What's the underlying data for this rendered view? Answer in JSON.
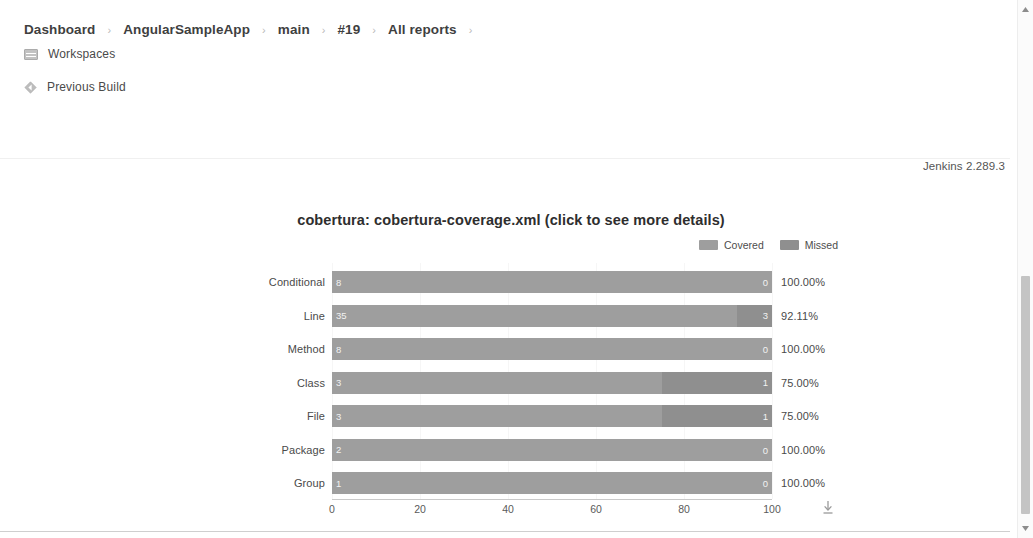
{
  "breadcrumb": {
    "items": [
      {
        "label": "Dashboard"
      },
      {
        "label": "AngularSampleApp"
      },
      {
        "label": "main"
      },
      {
        "label": "#19"
      },
      {
        "label": "All reports"
      }
    ],
    "separator": "›"
  },
  "menu": {
    "workspaces": {
      "label": "Workspaces",
      "icon": "workspaces-icon"
    },
    "previous_build": {
      "label": "Previous Build",
      "icon": "previous-build-icon"
    }
  },
  "footer": {
    "jenkins_version": "Jenkins 2.289.3"
  },
  "chart_panel": {
    "title": "cobertura: cobertura-coverage.xml (click to see more details)",
    "download_icon": "download-icon"
  },
  "colors": {
    "covered": "#9e9e9e",
    "missed": "#8f8f8f",
    "text": "#4a4a4a"
  },
  "chart_data": {
    "type": "bar",
    "title": "cobertura: cobertura-coverage.xml (click to see more details)",
    "xlabel": "",
    "ylabel": "",
    "orientation": "horizontal",
    "stacked": true,
    "grid": false,
    "legend_position": "top-right",
    "xlim": [
      0,
      100
    ],
    "xticks": [
      0,
      20,
      40,
      60,
      80,
      100
    ],
    "categories": [
      "Conditional",
      "Line",
      "Method",
      "Class",
      "File",
      "Package",
      "Group"
    ],
    "legend": [
      "Covered",
      "Missed"
    ],
    "series": [
      {
        "name": "Covered",
        "values": [
          8,
          35,
          8,
          3,
          3,
          2,
          1
        ]
      },
      {
        "name": "Missed",
        "values": [
          0,
          3,
          0,
          1,
          1,
          0,
          0
        ]
      }
    ],
    "percent_labels": [
      "100.00%",
      "92.11%",
      "100.00%",
      "75.00%",
      "75.00%",
      "100.00%",
      "100.00%"
    ],
    "rows": [
      {
        "category": "Conditional",
        "covered": 8,
        "missed": 0,
        "percent": "100.00%",
        "covered_pct": 100,
        "missed_pct": 0
      },
      {
        "category": "Line",
        "covered": 35,
        "missed": 3,
        "percent": "92.11%",
        "covered_pct": 92.11,
        "missed_pct": 7.89
      },
      {
        "category": "Method",
        "covered": 8,
        "missed": 0,
        "percent": "100.00%",
        "covered_pct": 100,
        "missed_pct": 0
      },
      {
        "category": "Class",
        "covered": 3,
        "missed": 1,
        "percent": "75.00%",
        "covered_pct": 75,
        "missed_pct": 25
      },
      {
        "category": "File",
        "covered": 3,
        "missed": 1,
        "percent": "75.00%",
        "covered_pct": 75,
        "missed_pct": 25
      },
      {
        "category": "Package",
        "covered": 2,
        "missed": 0,
        "percent": "100.00%",
        "covered_pct": 100,
        "missed_pct": 0
      },
      {
        "category": "Group",
        "covered": 1,
        "missed": 0,
        "percent": "100.00%",
        "covered_pct": 100,
        "missed_pct": 0
      }
    ]
  }
}
